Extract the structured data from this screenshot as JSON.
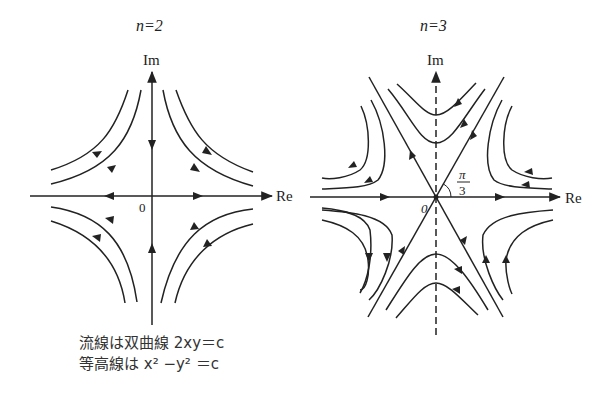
{
  "panels": [
    {
      "id": "n2",
      "title": "n=2",
      "axis_x_label": "Re",
      "axis_y_label": "Im",
      "origin_label": "0",
      "caption_lines": [
        "流線は双曲線 2xy＝c",
        "等高線は x² −y² ＝c"
      ]
    },
    {
      "id": "n3",
      "title": "n=3",
      "axis_x_label": "Re",
      "axis_y_label": "Im",
      "origin_label": "0",
      "angle_label_num": "π",
      "angle_label_den": "3"
    }
  ]
}
